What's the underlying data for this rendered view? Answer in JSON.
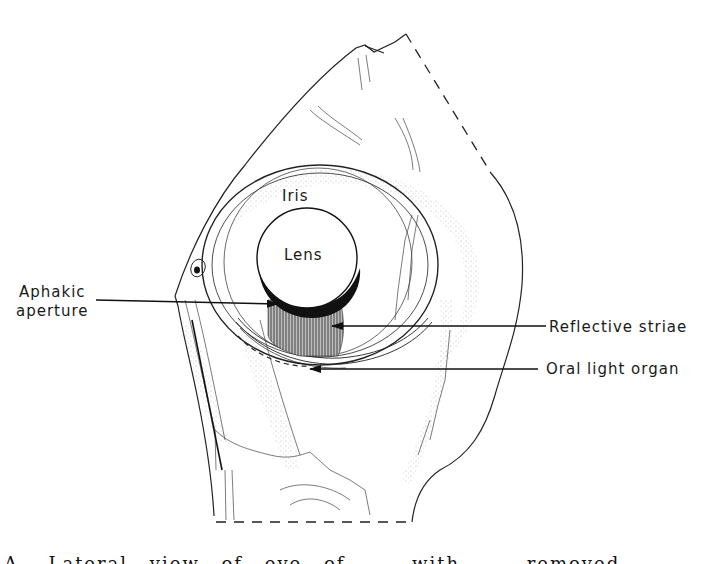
{
  "figure": {
    "labels": {
      "iris": "Iris",
      "lens": "Lens",
      "aphakic_aperture_line1": "Aphakic",
      "aphakic_aperture_line2": "aperture",
      "reflective_striae": "Reflective striae",
      "oral_light_organ": "Oral light organ"
    },
    "caption": "A. Lateral view of eye of ... with ... removed ..."
  },
  "colors": {
    "ink": "#1a1a1a",
    "stipple": "#9a9a9a",
    "background": "#ffffff"
  }
}
